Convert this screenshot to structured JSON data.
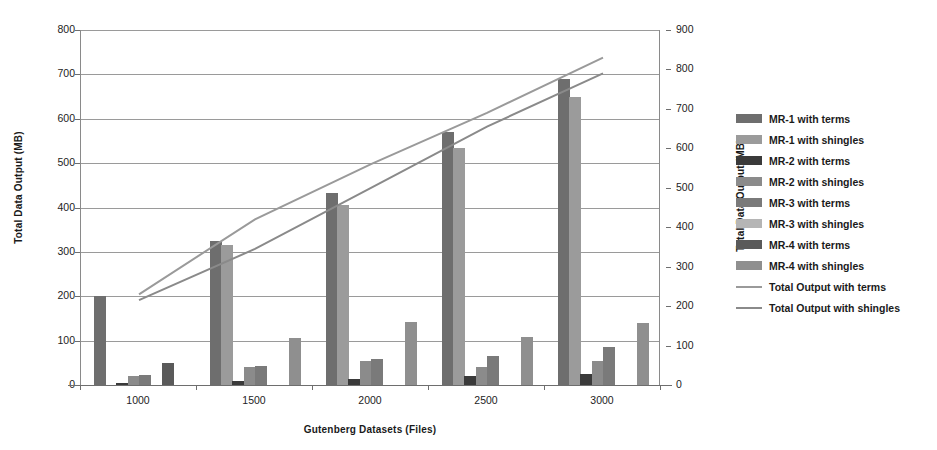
{
  "chart_data": {
    "type": "bar",
    "title": "",
    "xlabel": "Gutenberg Datasets (Files)",
    "ylabel": "Total Data Output (MB)",
    "ylabel_secondary": "Total Data Output (MB)",
    "categories": [
      "1000",
      "1500",
      "2000",
      "2500",
      "3000"
    ],
    "ylim": [
      0,
      800
    ],
    "yticks": [
      "800",
      "700",
      "600",
      "500",
      "400",
      "300",
      "200",
      "100",
      "0"
    ],
    "ylim_secondary": [
      0,
      900
    ],
    "yticks_secondary": [
      "900",
      "800",
      "700",
      "600",
      "500",
      "400",
      "300",
      "200",
      "100",
      "0"
    ],
    "grid": true,
    "legend_position": "right",
    "series": [
      {
        "name": "MR-1 with terms",
        "axis": "left",
        "kind": "bar",
        "color": "#6e6e6e",
        "values": [
          200,
          325,
          432,
          570,
          690
        ]
      },
      {
        "name": "MR-1 with shingles",
        "axis": "left",
        "kind": "bar",
        "color": "#9b9b9b",
        "values": [
          0,
          315,
          405,
          535,
          650
        ]
      },
      {
        "name": "MR-2 with terms",
        "axis": "left",
        "kind": "bar",
        "color": "#3a3a3a",
        "values": [
          4,
          10,
          14,
          20,
          25
        ]
      },
      {
        "name": "MR-2 with shingles",
        "axis": "left",
        "kind": "bar",
        "color": "#8b8b8b",
        "values": [
          20,
          40,
          55,
          40,
          55
        ]
      },
      {
        "name": "MR-3 with terms",
        "axis": "left",
        "kind": "bar",
        "color": "#7a7a7a",
        "values": [
          22,
          42,
          58,
          65,
          85
        ]
      },
      {
        "name": "MR-3 with shingles",
        "axis": "left",
        "kind": "bar",
        "color": "#b5b5b5",
        "values": [
          0,
          0,
          0,
          0,
          0
        ]
      },
      {
        "name": "MR-4 with terms",
        "axis": "left",
        "kind": "bar",
        "color": "#5a5a5a",
        "values": [
          50,
          0,
          0,
          0,
          0
        ]
      },
      {
        "name": "MR-4 with shingles",
        "axis": "left",
        "kind": "bar",
        "color": "#8f8f8f",
        "values": [
          0,
          105,
          141,
          108,
          140
        ]
      },
      {
        "name": "Total Output with terms",
        "axis": "right",
        "kind": "line",
        "color": "#9a9a9a",
        "values": [
          230,
          420,
          560,
          690,
          830
        ]
      },
      {
        "name": "Total Output with shingles",
        "axis": "right",
        "kind": "line",
        "color": "#8a8a8a",
        "values": [
          215,
          345,
          500,
          655,
          790
        ]
      }
    ]
  }
}
